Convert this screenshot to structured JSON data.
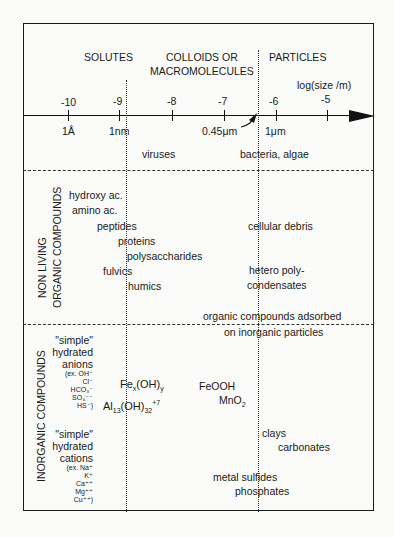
{
  "header": {
    "categories": [
      "SOLUTES",
      "COLLOIDS OR",
      "MACROMOLECULES",
      "PARTICLES"
    ],
    "axis_label": "log(size /m)",
    "axis_ticks": [
      "-10",
      "-9",
      "-8",
      "-7",
      "-6",
      "-5"
    ],
    "size_labels": [
      "1Å",
      "1nm",
      "0.45μm",
      "1μm"
    ],
    "organisms": [
      "viruses",
      "bacteria, algae"
    ]
  },
  "organic": {
    "section_label_1": "NON LIVING",
    "section_label_2": "ORGANIC COMPOUNDS",
    "items": [
      "hydroxy ac.",
      "amino ac.",
      "peptides",
      "proteins",
      "polysaccharides",
      "fulvics",
      "humics",
      "cellular debris",
      "hetero poly-",
      "condensates",
      "organic compounds adsorbed",
      "on inorganic particles"
    ]
  },
  "inorganic": {
    "section_label": "INORGANIC COMPOUNDS",
    "anions_title": [
      "\"simple\"",
      "hydrated",
      "anions"
    ],
    "anions_examples": [
      "(ex. OH⁻",
      "Cl⁻",
      "HCO₃⁻",
      "SO₄⁻⁻",
      "HS⁻)"
    ],
    "cations_title": [
      "\"simple\"",
      "hydrated",
      "cations"
    ],
    "cations_examples": [
      "(ex. Na⁺",
      "K⁺",
      "Ca⁺⁺",
      "Mg⁺⁺",
      "Cu⁺⁺)"
    ],
    "fe_base": "Fe",
    "fe_x": "x",
    "fe_oh": "(OH)",
    "fe_y": "y",
    "al_base": "Al",
    "al_13": "13",
    "al_oh": "(OH)",
    "al_32": "32",
    "al_charge": "+7",
    "feooh": "FeOOH",
    "mno_base": "MnO",
    "mno_sub": "2",
    "items": [
      "clays",
      "carbonates",
      "metal sulfides",
      "phosphates"
    ]
  }
}
